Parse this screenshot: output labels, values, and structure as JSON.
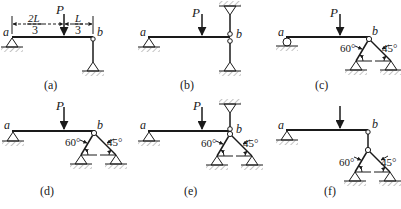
{
  "figure": {
    "panels": [
      {
        "id": "a",
        "caption": "(a)",
        "end_a": "a",
        "end_b": "b",
        "load": "P",
        "dims": [
          {
            "num": "2L",
            "den": "3"
          },
          {
            "num": "L",
            "den": "3"
          }
        ],
        "support_a": "pin",
        "support_b": "link-to-pin-below"
      },
      {
        "id": "b",
        "caption": "(b)",
        "end_a": "a",
        "end_b": "b",
        "load": "P",
        "support_a": "pin",
        "support_b": "column-pinned-top-and-bottom"
      },
      {
        "id": "c",
        "caption": "(c)",
        "end_a": "a",
        "end_b": "b",
        "load": "P",
        "support_a": "roller",
        "support_b": "two-bar-truss",
        "angles": [
          "60°",
          "45°"
        ]
      },
      {
        "id": "d",
        "caption": "(d)",
        "end_a": "a",
        "end_b": "b",
        "load": "P",
        "support_a": "pin",
        "support_b": "two-bar-truss",
        "angles": [
          "60°",
          "45°"
        ]
      },
      {
        "id": "e",
        "caption": "(e)",
        "end_a": "a",
        "end_b": "b",
        "load": "P",
        "support_a": "pin",
        "support_b": "two-bar-truss-plus-top-pin",
        "angles": [
          "60°",
          "45°"
        ]
      },
      {
        "id": "f",
        "caption": "(f)",
        "end_a": "a",
        "end_b": "b",
        "load": "P",
        "support_a": "pin",
        "support_b": "link-to-two-bar-truss",
        "angles": [
          "60°",
          "45°"
        ]
      }
    ]
  }
}
